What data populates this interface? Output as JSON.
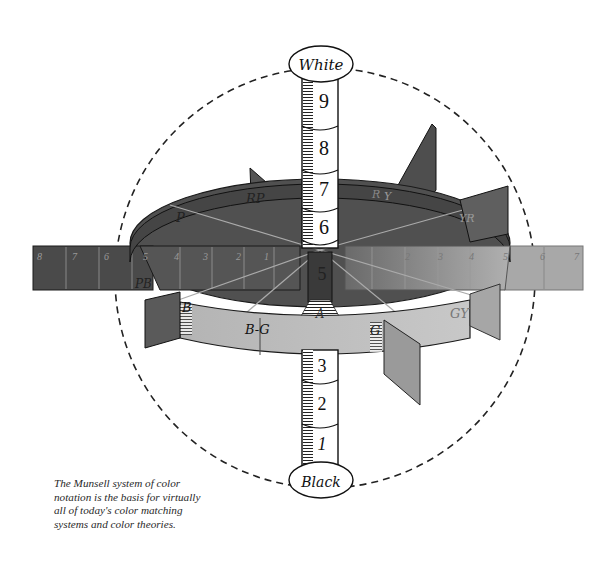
{
  "diagram": {
    "axis": {
      "top_label": "White",
      "bottom_label": "Black",
      "value_scale_top": [
        "9",
        "8",
        "7",
        "6"
      ],
      "value_center": "5",
      "value_scale_bottom": [
        "3",
        "2",
        "1"
      ]
    },
    "hue_labels": [
      "RP",
      "P",
      "PB",
      "B",
      "B-G",
      "G",
      "GY",
      "Y",
      "YR",
      "R"
    ],
    "center_label": "A",
    "left_chroma_scale": [
      "8",
      "7",
      "6",
      "5",
      "4",
      "3",
      "2",
      "1"
    ],
    "right_chroma_scale": [
      "1",
      "2",
      "3",
      "4",
      "5",
      "6",
      "7"
    ],
    "colors": {
      "background": "#ffffff",
      "dark_panel": "#4a4a4a",
      "mid_panel": "#6e6e6e",
      "light_band": "#b8b8b8",
      "right_panel": "#a0a0a0",
      "outline": "#1a1a1a"
    }
  },
  "caption": {
    "lines": [
      "The Munsell system of color",
      "notation is the basis for virtually",
      "all of today's color matching",
      "systems and color theories."
    ]
  }
}
